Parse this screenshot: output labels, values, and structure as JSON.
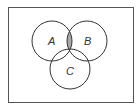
{
  "diagram": {
    "type": "venn",
    "sets": [
      {
        "label": "A",
        "cx": 52,
        "cy": 41,
        "r": 20
      },
      {
        "label": "B",
        "cx": 87,
        "cy": 41,
        "r": 20
      },
      {
        "label": "C",
        "cx": 70,
        "cy": 69,
        "r": 20
      }
    ],
    "shaded_region": "A ∩ B",
    "colors": {
      "stroke": "#333333",
      "shade": "#a9a9a9",
      "border": "#555555",
      "background": "#ffffff"
    }
  }
}
